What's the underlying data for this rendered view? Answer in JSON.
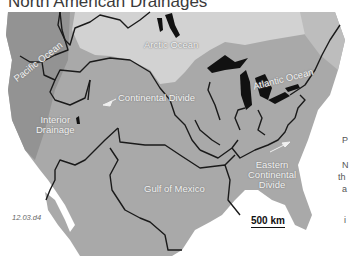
{
  "title": "North American Drainages",
  "figure_id": "12.03.d4",
  "scale_bar": "500 km",
  "labels": {
    "arctic": "Arctic Ocean",
    "pacific": "Pacific Ocean",
    "atlantic": "Atlantic Ocean",
    "continental_divide": "Continental Divide",
    "interior_line1": "Interior",
    "interior_line2": "Drainage",
    "gulf": "Gulf of Mexico",
    "eastern_line1": "Eastern",
    "eastern_line2": "Continental",
    "eastern_line3": "Divide"
  },
  "side_text_fragments": [
    "P",
    "N",
    "th",
    "a",
    "i"
  ],
  "colors": {
    "land": "#a9a9a9",
    "arctic_basin": "#d2d2d2",
    "dark_land": "#8e8e8e",
    "water": "#ffffff",
    "lakes": "#111111",
    "divide_lines": "#1a1a1a"
  }
}
